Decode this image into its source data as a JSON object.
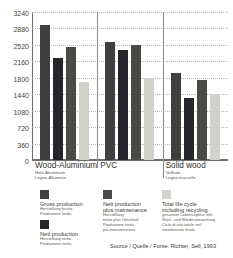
{
  "chart_data": {
    "type": "bar",
    "title": "",
    "xlabel": "",
    "ylabel": "Primary energy / Primärenergie / Energia primaria",
    "ylim": [
      0,
      3240
    ],
    "yticks": [
      0,
      360,
      720,
      1080,
      1440,
      1800,
      2160,
      2520,
      2880,
      3240
    ],
    "grid": true,
    "legend_position": "bottom",
    "categories": [
      "Wood-Aluminium",
      "PVC",
      "Solid wood"
    ],
    "series": [
      {
        "name": "Gross production",
        "values": [
          2960,
          2575,
          1905
        ]
      },
      {
        "name": "Nett production",
        "values": [
          2230,
          2400,
          1355
        ]
      },
      {
        "name": "Nett production plus maintenance",
        "values": [
          2470,
          2510,
          1760
        ]
      },
      {
        "name": "Total life cycle including recycling",
        "values": [
          1715,
          1800,
          1440
        ]
      }
    ],
    "source": "Source / Quelle / Fonte: Richter, Sell, 1993"
  },
  "axis": {
    "y_title": "Primary energy / Primärenergie / Energia primaria (MJ/m²/Jahr)",
    "ticks": [
      "3240",
      "2880",
      "2520",
      "2160",
      "1800",
      "1440",
      "1080",
      "720",
      "360",
      "0"
    ]
  },
  "categories": [
    {
      "main": "Wood-Aluminium",
      "sub_de": "Holz-Aluminium",
      "sub_it": "Legno-Alluminio"
    },
    {
      "main": "PVC",
      "sub_de": "",
      "sub_it": ""
    },
    {
      "main": "Solid wood",
      "sub_de": "Vollholz",
      "sub_it": "Legno massello"
    }
  ],
  "legend": [
    {
      "main": "Gross production",
      "sub": "Herstellung brutto\nProduzione lorda",
      "color": "#3f3f3d"
    },
    {
      "main": "Nett production",
      "sub": "Herstellung netto\nProduzione netta",
      "color": "#26262a"
    },
    {
      "main": "Nett production\nplus maintenance",
      "sub": "Herstellung\nnetto plus Unterhalt\nProduzione netta\npiù manutenzione",
      "color": "#4a4a47"
    },
    {
      "main": "Total life cycle\nincluding recycling",
      "sub": "gesamter Lebenszyklus inkl.\nRück- und Wiederverwertung\nCiclo di vita totale incl.\nsmaltimento finale",
      "color": "#d2d2cd"
    }
  ],
  "source": "Source / Quelle / Fonte: Richter, Sell, 1993"
}
